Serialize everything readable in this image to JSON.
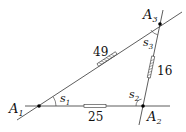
{
  "diagram": {
    "points": [
      {
        "id": "A1",
        "label": "A",
        "sub": "1"
      },
      {
        "id": "A2",
        "label": "A",
        "sub": "2"
      },
      {
        "id": "A3",
        "label": "A",
        "sub": "3"
      }
    ],
    "angles": [
      {
        "id": "s1",
        "label": "s",
        "sub": "1"
      },
      {
        "id": "s2",
        "label": "s",
        "sub": "2"
      },
      {
        "id": "s3",
        "label": "s",
        "sub": "3"
      }
    ],
    "edges": [
      {
        "from": "A1",
        "to": "A3",
        "length": "49"
      },
      {
        "from": "A2",
        "to": "A3",
        "length": "16"
      },
      {
        "from": "A1",
        "to": "A2",
        "length": "25"
      }
    ]
  }
}
